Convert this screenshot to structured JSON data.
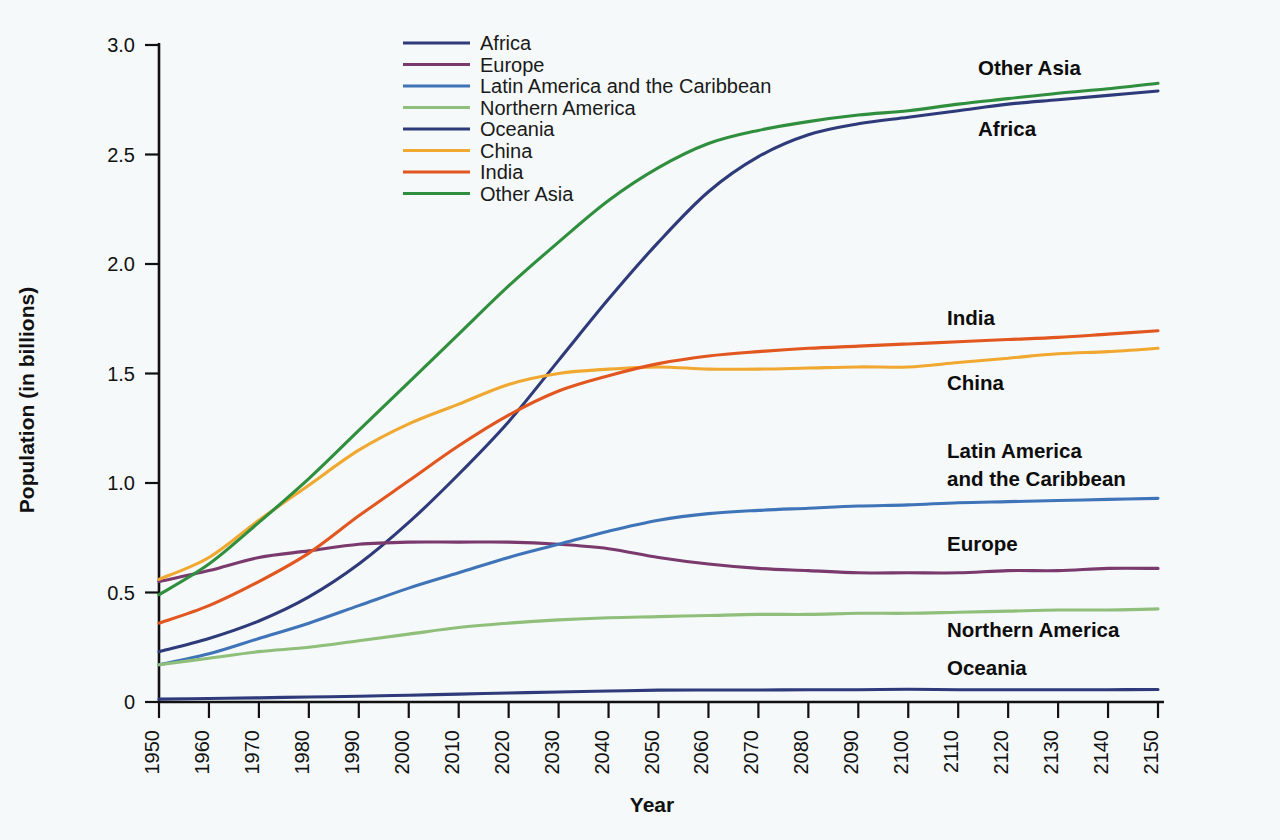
{
  "chart_data": {
    "type": "line",
    "title": "",
    "xlabel": "Year",
    "ylabel": "Population (in billions)",
    "xlim": [
      1950,
      2150
    ],
    "ylim": [
      0,
      3.0
    ],
    "grid": false,
    "legend_position": "top-center-left",
    "x_ticks": [
      1950,
      1960,
      1970,
      1980,
      1990,
      2000,
      2010,
      2020,
      2030,
      2040,
      2050,
      2060,
      2070,
      2080,
      2090,
      2100,
      2110,
      2120,
      2130,
      2140,
      2150
    ],
    "y_ticks": [
      "0",
      "0.5",
      "1.0",
      "1.5",
      "2.0",
      "2.5",
      "3.0"
    ],
    "y_tick_values": [
      0,
      0.5,
      1.0,
      1.5,
      2.0,
      2.5,
      3.0
    ],
    "x": [
      1950,
      1960,
      1970,
      1980,
      1990,
      2000,
      2010,
      2020,
      2030,
      2040,
      2050,
      2060,
      2070,
      2080,
      2090,
      2100,
      2110,
      2120,
      2130,
      2140,
      2150
    ],
    "series": [
      {
        "name": "Africa",
        "color": "#2e3a7a",
        "end_label": "Africa",
        "end_label_value": 2.79,
        "values": [
          0.23,
          0.29,
          0.37,
          0.48,
          0.63,
          0.82,
          1.04,
          1.28,
          1.56,
          1.84,
          2.1,
          2.33,
          2.49,
          2.59,
          2.64,
          2.67,
          2.7,
          2.73,
          2.75,
          2.77,
          2.79
        ]
      },
      {
        "name": "Europe",
        "color": "#7a3a6e",
        "end_label": "Europe",
        "end_label_value": 0.61,
        "values": [
          0.55,
          0.6,
          0.66,
          0.69,
          0.72,
          0.73,
          0.73,
          0.73,
          0.72,
          0.7,
          0.66,
          0.63,
          0.61,
          0.6,
          0.59,
          0.59,
          0.59,
          0.6,
          0.6,
          0.61,
          0.61
        ]
      },
      {
        "name": "Latin America and the Caribbean",
        "color": "#3f74b8",
        "end_label": "Latin America\nand the Caribbean",
        "end_label_value": 0.93,
        "values": [
          0.17,
          0.22,
          0.29,
          0.36,
          0.44,
          0.52,
          0.59,
          0.66,
          0.72,
          0.78,
          0.83,
          0.86,
          0.875,
          0.885,
          0.895,
          0.9,
          0.91,
          0.915,
          0.92,
          0.925,
          0.93
        ]
      },
      {
        "name": "Northern America",
        "color": "#8fbf7a",
        "end_label": "Northern America",
        "end_label_value": 0.425,
        "values": [
          0.17,
          0.2,
          0.23,
          0.25,
          0.28,
          0.31,
          0.34,
          0.36,
          0.375,
          0.385,
          0.39,
          0.395,
          0.4,
          0.4,
          0.405,
          0.405,
          0.41,
          0.415,
          0.42,
          0.42,
          0.425
        ]
      },
      {
        "name": "Oceania",
        "color": "#2e3a7a",
        "end_label": "Oceania",
        "end_label_value": 0.055,
        "values": [
          0.013,
          0.016,
          0.019,
          0.023,
          0.026,
          0.031,
          0.036,
          0.041,
          0.046,
          0.05,
          0.054,
          0.055,
          0.055,
          0.056,
          0.056,
          0.058,
          0.056,
          0.056,
          0.056,
          0.056,
          0.057
        ]
      },
      {
        "name": "China",
        "color": "#f0a830",
        "end_label": "China",
        "end_label_value": 1.615,
        "values": [
          0.56,
          0.66,
          0.83,
          0.99,
          1.15,
          1.27,
          1.36,
          1.45,
          1.5,
          1.52,
          1.53,
          1.52,
          1.52,
          1.525,
          1.53,
          1.53,
          1.55,
          1.57,
          1.59,
          1.6,
          1.615
        ]
      },
      {
        "name": "India",
        "color": "#e2561f",
        "end_label": "India",
        "end_label_value": 1.695,
        "values": [
          0.36,
          0.44,
          0.55,
          0.68,
          0.85,
          1.01,
          1.17,
          1.31,
          1.42,
          1.49,
          1.545,
          1.58,
          1.6,
          1.615,
          1.625,
          1.635,
          1.645,
          1.655,
          1.665,
          1.68,
          1.695
        ]
      },
      {
        "name": "Other Asia",
        "color": "#2f8f3e",
        "end_label": "Other Asia",
        "end_label_value": 2.825,
        "values": [
          0.49,
          0.63,
          0.82,
          1.02,
          1.24,
          1.46,
          1.68,
          1.9,
          2.1,
          2.29,
          2.44,
          2.55,
          2.61,
          2.65,
          2.68,
          2.7,
          2.73,
          2.755,
          2.78,
          2.8,
          2.825
        ]
      }
    ]
  },
  "legend": {
    "items": [
      {
        "label": "Africa",
        "color": "#2e3a7a"
      },
      {
        "label": "Europe",
        "color": "#7a3a6e"
      },
      {
        "label": "Latin America and the Caribbean",
        "color": "#3f74b8"
      },
      {
        "label": "Northern America",
        "color": "#8fbf7a"
      },
      {
        "label": "Oceania",
        "color": "#2e3a7a"
      },
      {
        "label": "China",
        "color": "#f0a830"
      },
      {
        "label": "India",
        "color": "#e2561f"
      },
      {
        "label": "Other Asia",
        "color": "#2f8f3e"
      }
    ]
  },
  "annotations": [
    {
      "text": "Other Asia",
      "x": 978,
      "y": 75
    },
    {
      "text": "Africa",
      "x": 978,
      "y": 136
    },
    {
      "text": "India",
      "x": 947,
      "y": 325
    },
    {
      "text": "China",
      "x": 947,
      "y": 390
    },
    {
      "text": "Latin America",
      "x": 947,
      "y": 458
    },
    {
      "text": "and the Caribbean",
      "x": 947,
      "y": 486
    },
    {
      "text": "Europe",
      "x": 947,
      "y": 551
    },
    {
      "text": "Northern America",
      "x": 947,
      "y": 637
    },
    {
      "text": "Oceania",
      "x": 947,
      "y": 675
    }
  ],
  "colors": {
    "background": "#f5f9f9",
    "axis": "#111111",
    "text": "#111111"
  }
}
